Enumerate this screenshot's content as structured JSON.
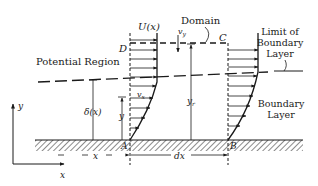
{
  "labels": {
    "domain": "Domain",
    "potential_region": "Potential Region",
    "limit_line1": "Limit of",
    "limit_line2": "Boundary",
    "limit_line3": "Layer",
    "boundary_line1": "Boundary",
    "boundary_line2": "Layer",
    "U": "U(x)",
    "vy": "v",
    "vy_sub": "y",
    "vx": "v",
    "vx_sub": "x",
    "D": "D",
    "C": "C",
    "A": "A",
    "B": "B",
    "delta": "δ(x)",
    "y_local": "y",
    "yr": "y",
    "yr_sub": "r",
    "x_dim": "x",
    "dx_dim": "dx",
    "axis_y": "y",
    "axis_x": "x"
  },
  "colors": {
    "ink": "#1a1a1a",
    "background": "#ffffff"
  }
}
